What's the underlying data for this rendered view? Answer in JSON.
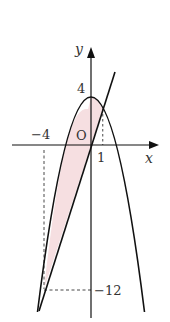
{
  "diagram": {
    "type": "coordinate-graph",
    "axes": {
      "x_label": "x",
      "y_label": "y",
      "origin_label": "O"
    },
    "tick_labels": {
      "y_top": "4",
      "x_neg": "−4",
      "x_pos": "1",
      "y_neg": "−12"
    },
    "curves": [
      {
        "name": "parabola",
        "equation": "y = 4 - x^2"
      },
      {
        "name": "line",
        "equation": "y = 3x"
      }
    ],
    "intersections": [
      [
        1,
        3
      ],
      [
        -4,
        -12
      ]
    ],
    "shaded_region": {
      "between": [
        "parabola",
        "line"
      ],
      "x_range": [
        -4,
        1
      ],
      "color": "#f6dfe1"
    },
    "colors": {
      "stroke": "#111111",
      "shade": "#f6dfe1",
      "text": "#333333"
    }
  }
}
